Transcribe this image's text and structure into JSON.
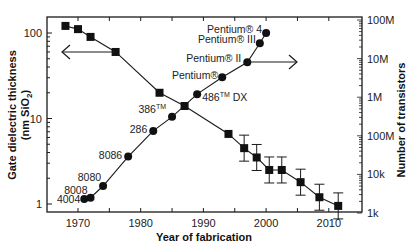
{
  "chart_data": {
    "type": "scatter",
    "title": "",
    "xlabel": "Year of fabrication",
    "ylabel_left": "Gate dielectric thickness (nm SiO2)",
    "ylabel_right": "Number of transistors",
    "xlim": [
      1965,
      2015
    ],
    "ylim_left": [
      0.85,
      150
    ],
    "ylim_right": [
      1000,
      100000000
    ],
    "yscale": "log",
    "x_ticks": [
      1970,
      1980,
      1990,
      2000,
      2010
    ],
    "y_ticks_left": [
      {
        "value": 1,
        "label": "1"
      },
      {
        "value": 10,
        "label": "10"
      },
      {
        "value": 100,
        "label": "100"
      }
    ],
    "y_ticks_right": [
      {
        "value": 1000,
        "label": "1k"
      },
      {
        "value": 10000,
        "label": "10k"
      },
      {
        "value": 100000,
        "label": "100M"
      },
      {
        "value": 1000000,
        "label": "1M"
      },
      {
        "value": 10000000,
        "label": "10M"
      },
      {
        "value": 100000000,
        "label": "100M"
      }
    ],
    "grid": false,
    "series": [
      {
        "name": "Gate dielectric thickness",
        "axis": "left",
        "marker": "square",
        "x": [
          1968,
          1970,
          1972,
          1976,
          1983,
          1987,
          1994,
          1996.5,
          1998.5,
          2000.5,
          2002.5,
          2005.5,
          2008.5,
          2011.5
        ],
        "values": [
          121,
          111,
          90,
          60,
          20,
          14,
          6.6,
          4.5,
          3.5,
          2.5,
          2.5,
          1.8,
          1.2,
          0.95
        ],
        "error_bars": [
          false,
          false,
          false,
          false,
          false,
          false,
          false,
          true,
          true,
          true,
          true,
          true,
          true,
          true
        ]
      },
      {
        "name": "Number of transistors",
        "axis": "right",
        "marker": "circle",
        "x": [
          1971,
          1972,
          1974,
          1978,
          1982,
          1985,
          1989,
          1993,
          1997,
          1999,
          2000
        ],
        "values": [
          2300,
          2500,
          5000,
          29000,
          134000,
          310000,
          1200000,
          3300000,
          8000000,
          25000000,
          46000000
        ],
        "point_labels": [
          "4004",
          "8008",
          "8080",
          "8086",
          "286",
          "386™",
          "486™ DX",
          "Pentium®",
          "Pentium® II",
          "Pentium® III",
          "Pentium® 4"
        ]
      }
    ],
    "annotations": [
      {
        "type": "arrow",
        "direction": "left",
        "meaning": "squares use left axis"
      },
      {
        "type": "arrow",
        "direction": "right",
        "meaning": "circles use right axis"
      }
    ]
  },
  "labels": {
    "xlabel": "Year of fabrication",
    "ylabel_left_line1": "Gate dielectric thickness",
    "ylabel_left_line2": "(nm SiO",
    "ylabel_left_sub": "2",
    "ylabel_left_close": ")",
    "ylabel_right": "Number of transistors"
  }
}
